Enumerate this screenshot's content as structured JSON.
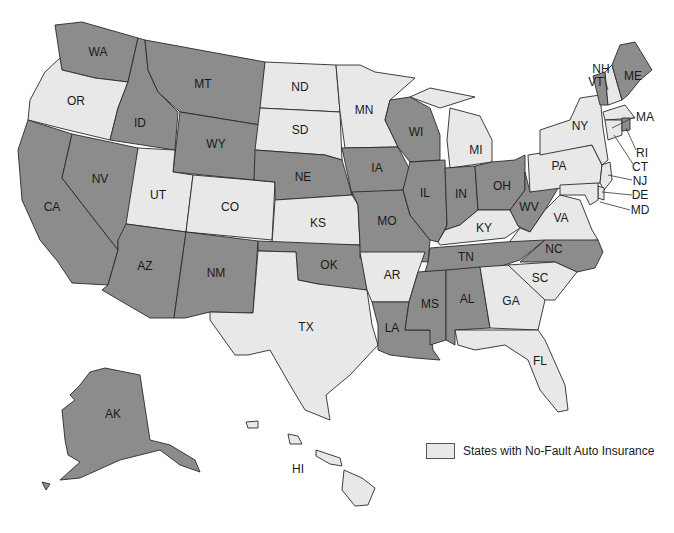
{
  "map": {
    "title": "States with No-Fault Auto Insurance",
    "colors": {
      "no_fault": "#e8e8e8",
      "other": "#8c8c8c",
      "border": "#2a2a2a"
    },
    "states": [
      {
        "abbr": "WA",
        "no_fault": false
      },
      {
        "abbr": "OR",
        "no_fault": true
      },
      {
        "abbr": "CA",
        "no_fault": false
      },
      {
        "abbr": "ID",
        "no_fault": false
      },
      {
        "abbr": "NV",
        "no_fault": false
      },
      {
        "abbr": "MT",
        "no_fault": false
      },
      {
        "abbr": "WY",
        "no_fault": false
      },
      {
        "abbr": "UT",
        "no_fault": true
      },
      {
        "abbr": "AZ",
        "no_fault": false
      },
      {
        "abbr": "CO",
        "no_fault": true
      },
      {
        "abbr": "NM",
        "no_fault": false
      },
      {
        "abbr": "ND",
        "no_fault": true
      },
      {
        "abbr": "SD",
        "no_fault": true
      },
      {
        "abbr": "NE",
        "no_fault": false
      },
      {
        "abbr": "KS",
        "no_fault": true
      },
      {
        "abbr": "OK",
        "no_fault": false
      },
      {
        "abbr": "TX",
        "no_fault": true
      },
      {
        "abbr": "MN",
        "no_fault": true
      },
      {
        "abbr": "IA",
        "no_fault": false
      },
      {
        "abbr": "MO",
        "no_fault": false
      },
      {
        "abbr": "AR",
        "no_fault": true
      },
      {
        "abbr": "LA",
        "no_fault": false
      },
      {
        "abbr": "WI",
        "no_fault": false
      },
      {
        "abbr": "IL",
        "no_fault": false
      },
      {
        "abbr": "MI",
        "no_fault": true
      },
      {
        "abbr": "IN",
        "no_fault": false
      },
      {
        "abbr": "OH",
        "no_fault": false
      },
      {
        "abbr": "KY",
        "no_fault": true
      },
      {
        "abbr": "TN",
        "no_fault": false
      },
      {
        "abbr": "MS",
        "no_fault": false
      },
      {
        "abbr": "AL",
        "no_fault": false
      },
      {
        "abbr": "GA",
        "no_fault": true
      },
      {
        "abbr": "FL",
        "no_fault": true
      },
      {
        "abbr": "SC",
        "no_fault": true
      },
      {
        "abbr": "NC",
        "no_fault": false
      },
      {
        "abbr": "VA",
        "no_fault": true
      },
      {
        "abbr": "WV",
        "no_fault": false
      },
      {
        "abbr": "PA",
        "no_fault": true
      },
      {
        "abbr": "NY",
        "no_fault": true
      },
      {
        "abbr": "VT",
        "no_fault": false
      },
      {
        "abbr": "NH",
        "no_fault": true
      },
      {
        "abbr": "ME",
        "no_fault": false
      },
      {
        "abbr": "MA",
        "no_fault": true
      },
      {
        "abbr": "RI",
        "no_fault": false
      },
      {
        "abbr": "CT",
        "no_fault": true
      },
      {
        "abbr": "NJ",
        "no_fault": true
      },
      {
        "abbr": "DE",
        "no_fault": true
      },
      {
        "abbr": "MD",
        "no_fault": true
      },
      {
        "abbr": "AK",
        "no_fault": false
      },
      {
        "abbr": "HI",
        "no_fault": true
      }
    ],
    "labels": {
      "WA": "WA",
      "OR": "OR",
      "CA": "CA",
      "ID": "ID",
      "NV": "NV",
      "MT": "MT",
      "WY": "WY",
      "UT": "UT",
      "AZ": "AZ",
      "CO": "CO",
      "NM": "NM",
      "ND": "ND",
      "SD": "SD",
      "NE": "NE",
      "KS": "KS",
      "OK": "OK",
      "TX": "TX",
      "MN": "MN",
      "IA": "IA",
      "MO": "MO",
      "AR": "AR",
      "LA": "LA",
      "WI": "WI",
      "IL": "IL",
      "MI": "MI",
      "IN": "IN",
      "OH": "OH",
      "KY": "KY",
      "TN": "TN",
      "MS": "MS",
      "AL": "AL",
      "GA": "GA",
      "FL": "FL",
      "SC": "SC",
      "NC": "NC",
      "VA": "VA",
      "WV": "WV",
      "PA": "PA",
      "NY": "NY",
      "VT": "VT",
      "NH": "NH",
      "ME": "ME",
      "MA": "MA",
      "RI": "RI",
      "CT": "CT",
      "NJ": "NJ",
      "DE": "DE",
      "MD": "MD",
      "AK": "AK",
      "HI": "HI"
    }
  },
  "legend": {
    "label": "States with No-Fault Auto Insurance",
    "swatch_color": "#e8e8e8"
  }
}
